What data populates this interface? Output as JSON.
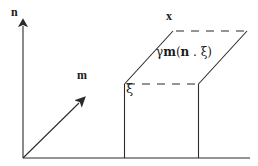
{
  "figure": {
    "background_color": "#ffffff",
    "stroke_color": "#2b2b2b",
    "text_color": "#1a1a1a",
    "width": 258,
    "height": 166
  },
  "labels": {
    "normal_axis": "n",
    "slip_direction": "m",
    "displaced_point": "x",
    "reference_vector": "ξ",
    "shear_expression": {
      "full": "γm(n . ξ)",
      "gamma": "γ",
      "m": "m",
      "open_paren": "(",
      "n": "n",
      "dot": " . ",
      "xi": "ξ",
      "close_paren": ")"
    }
  },
  "geometry": {
    "origin": {
      "x": 23,
      "y": 158
    },
    "baseline": {
      "x1": 23,
      "y1": 158,
      "x2": 250,
      "y2": 158
    },
    "n_arrow": {
      "x1": 23,
      "y1": 158,
      "x2": 23,
      "y2": 14
    },
    "m_arrow": {
      "x1": 23,
      "y1": 158,
      "x2": 87,
      "y2": 95
    },
    "block_left_edge": {
      "x1": 124,
      "y1": 84,
      "x2": 124,
      "y2": 158
    },
    "block_right_edge": {
      "x1": 198,
      "y1": 84,
      "x2": 198,
      "y2": 158
    },
    "front_top_dashed": {
      "x1": 127,
      "y1": 84,
      "x2": 197,
      "y2": 84
    },
    "shear_left_diagonal": {
      "x1": 124,
      "y1": 84,
      "x2": 173,
      "y2": 31
    },
    "shear_right_diagonal": {
      "x1": 198,
      "y1": 84,
      "x2": 247,
      "y2": 31
    },
    "top_dashed": {
      "x1": 176,
      "y1": 31,
      "x2": 246,
      "y2": 31
    },
    "dash_pattern": "8 7"
  }
}
